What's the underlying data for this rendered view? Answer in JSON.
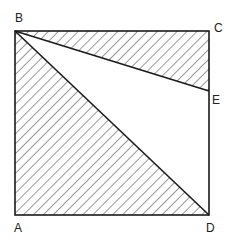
{
  "diagram": {
    "type": "geometry-square",
    "stroke_color": "#1a1a1a",
    "hatch_color": "#333333",
    "points": {
      "A": {
        "label": "A",
        "x": 15,
        "y": 215
      },
      "B": {
        "label": "B",
        "x": 15,
        "y": 31
      },
      "C": {
        "label": "C",
        "x": 209,
        "y": 31
      },
      "D": {
        "label": "D",
        "x": 209,
        "y": 215
      },
      "E": {
        "label": "E",
        "x": 209,
        "y": 91
      }
    },
    "labels": {
      "A": "A",
      "B": "B",
      "C": "C",
      "D": "D",
      "E": "E"
    },
    "shaded_regions": [
      "triangle ABD",
      "triangle BCE"
    ],
    "segments": [
      "AB",
      "BC",
      "CD",
      "DA",
      "BD",
      "BE"
    ]
  }
}
